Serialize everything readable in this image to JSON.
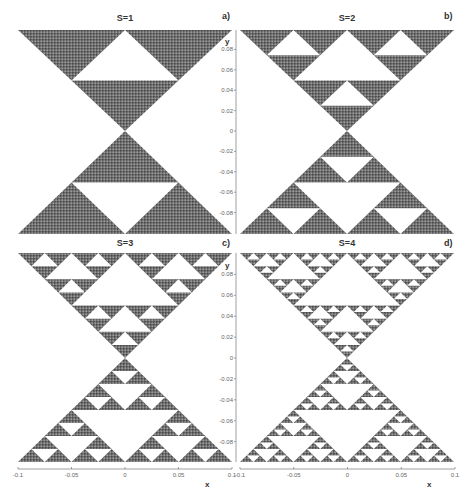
{
  "figure": {
    "description_visible": "Four Sierpinski-gasket hourglass fractal panels",
    "panels": [
      {
        "id": "a",
        "title": "S=1",
        "letter": "a)",
        "depth": 1
      },
      {
        "id": "b",
        "title": "S=2",
        "letter": "b)",
        "depth": 2
      },
      {
        "id": "c",
        "title": "S=3",
        "letter": "c)",
        "depth": 3
      },
      {
        "id": "d",
        "title": "S=4",
        "letter": "d)",
        "depth": 4
      }
    ],
    "y_axis": {
      "label": "y",
      "ticks": [
        "0.08",
        "0.06",
        "0.04",
        "0.02",
        "0",
        "-0.02",
        "-0.04",
        "-0.06",
        "-0.08"
      ]
    },
    "x_axis": {
      "label": "x",
      "ticks": [
        "-0.1",
        "-0.05",
        "0",
        "0.05",
        "0.1"
      ]
    },
    "colors": {
      "fill": "#6e6e6e",
      "fill_dark": "#4a4a4a",
      "fill_light": "#9a9a9a",
      "axis": "#888888",
      "background": "#ffffff"
    }
  },
  "chart_data": {
    "type": "other",
    "panels": [
      {
        "label": "a)",
        "title": "S=1",
        "iterations": 1
      },
      {
        "label": "b)",
        "title": "S=2",
        "iterations": 2
      },
      {
        "label": "c)",
        "title": "S=3",
        "iterations": 3
      },
      {
        "label": "d)",
        "title": "S=4",
        "iterations": 4
      }
    ],
    "xlabel": "x",
    "ylabel": "y",
    "xlim": [
      -0.1,
      0.1
    ],
    "ylim": [
      -0.1,
      0.1
    ],
    "x_ticks": [
      -0.1,
      -0.05,
      0,
      0.05,
      0.1
    ],
    "y_ticks": [
      0.08,
      0.06,
      0.04,
      0.02,
      0,
      -0.02,
      -0.04,
      -0.06,
      -0.08
    ],
    "grid": false
  }
}
